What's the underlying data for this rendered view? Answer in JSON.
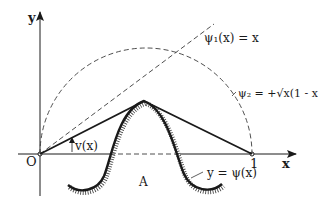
{
  "diagram": {
    "axes": {
      "x_label": "x",
      "y_label": "y",
      "origin_label": "O",
      "unit_mark_label": "1"
    },
    "curves": {
      "psi1": {
        "label": "ψ₁(x) = x",
        "style": "dashed"
      },
      "psi2": {
        "label": "ψ₂ = +√x(1 - x)",
        "style": "dashed"
      },
      "obstacle": {
        "label": "y = ψ(x)",
        "style": "solid-hatched"
      },
      "solution": {
        "label": "v(x)",
        "style": "solid"
      }
    },
    "region_label": "A",
    "colors": {
      "ink": "#1a1a1a",
      "dashed": "#3a3a3a",
      "background": "#ffffff"
    }
  }
}
